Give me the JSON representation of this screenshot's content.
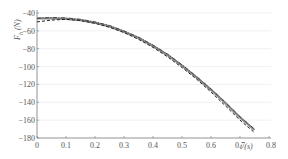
{
  "chart_data": {
    "type": "line",
    "title": "",
    "xlabel": "t (s)",
    "ylabel": "F_h (N)",
    "xlim": [
      0,
      0.8
    ],
    "ylim": [
      -180,
      -40
    ],
    "xticks": [
      "0",
      "0.1",
      "0.2",
      "0.3",
      "0.4",
      "0.5",
      "0.6",
      "0.7",
      "0.8"
    ],
    "yticks": [
      "-40",
      "-60",
      "-80",
      "-100",
      "-120",
      "-140",
      "-160",
      "-180"
    ],
    "grid": "horizontal",
    "legend": "none",
    "series": [
      {
        "name": "solid",
        "style": "solid",
        "color": "#888888",
        "x": [
          0,
          0.05,
          0.1,
          0.15,
          0.2,
          0.25,
          0.3,
          0.35,
          0.4,
          0.45,
          0.5,
          0.55,
          0.6,
          0.65,
          0.7,
          0.75
        ],
        "y": [
          -46,
          -46,
          -46.5,
          -48,
          -51,
          -55,
          -61,
          -68,
          -77,
          -87,
          -99,
          -112,
          -126,
          -141,
          -157,
          -171
        ]
      },
      {
        "name": "dash-dot",
        "style": "dashdot",
        "color": "#444444",
        "x": [
          0,
          0.05,
          0.1,
          0.15,
          0.2,
          0.25,
          0.3,
          0.35,
          0.4,
          0.45,
          0.5,
          0.55,
          0.6,
          0.65,
          0.7,
          0.75
        ],
        "y": [
          -46,
          -45,
          -45.5,
          -47,
          -50,
          -54,
          -60,
          -67,
          -76,
          -86,
          -98,
          -111,
          -125,
          -140,
          -156,
          -170
        ]
      },
      {
        "name": "dashed",
        "style": "dashed",
        "color": "#222222",
        "x": [
          0,
          0.05,
          0.1,
          0.15,
          0.2,
          0.25,
          0.3,
          0.35,
          0.4,
          0.45,
          0.5,
          0.55,
          0.6,
          0.65,
          0.7,
          0.75
        ],
        "y": [
          -50,
          -48,
          -47,
          -48.5,
          -51.5,
          -56,
          -62,
          -69.5,
          -78.5,
          -89,
          -101,
          -114,
          -128.5,
          -144,
          -160,
          -174
        ]
      }
    ]
  },
  "axes": {
    "ylabel_main": "F",
    "ylabel_sub": "h",
    "ylabel_unit": "(N)",
    "xlabel": "t (s)"
  }
}
